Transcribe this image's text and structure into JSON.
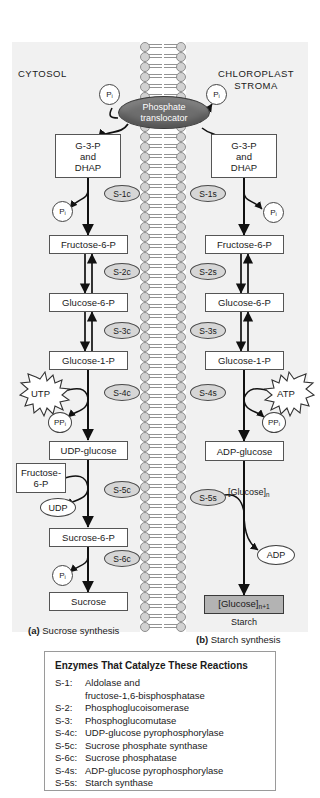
{
  "figure": {
    "compartments": {
      "left": "CYTOSOL",
      "right_line1": "CHLOROPLAST",
      "right_line2": "STROMA"
    },
    "translocator": {
      "line1": "Phosphate",
      "line2": "translocator"
    },
    "captions": {
      "a_letter": "(a)",
      "a_text": "Sucrose synthesis",
      "b_letter": "(b)",
      "b_text": "Starch synthesis"
    }
  },
  "cytosol_pathway": {
    "metabolites": [
      "G-3-P\nand\nDHAP",
      "Fructose-6-P",
      "Glucose-6-P",
      "Glucose-1-P",
      "UDP-glucose",
      "Sucrose-6-P",
      "Sucrose"
    ],
    "box1_line1": "G-3-P",
    "box1_line2": "and",
    "box1_line3": "DHAP",
    "fructose6p": "Fructose-6-P",
    "glucose6p": "Glucose-6-P",
    "glucose1p": "Glucose-1-P",
    "udp_glucose": "UDP-glucose",
    "sucrose6p": "Sucrose-6-P",
    "sucrose": "Sucrose",
    "enzymes": [
      "S-1c",
      "S-2c",
      "S-3c",
      "S-4c",
      "S-5c",
      "S-6c"
    ],
    "cofactors": {
      "pi_top": "P",
      "pi_top_sub": "i",
      "pi_s1c": "P",
      "pi_s1c_sub": "i",
      "utp": "UTP",
      "ppi": "PP",
      "ppi_sub": "i",
      "fructose_6p_side_l1": "Fructose-",
      "fructose_6p_side_l2": "6-P",
      "udp": "UDP",
      "pi_s6c": "P",
      "pi_s6c_sub": "i"
    }
  },
  "stroma_pathway": {
    "box1_line1": "G-3-P",
    "box1_line2": "and",
    "box1_line3": "DHAP",
    "fructose6p": "Fructose-6-P",
    "glucose6p": "Glucose-6-P",
    "glucose1p": "Glucose-1-P",
    "adp_glucose": "ADP-glucose",
    "glucose_n1": "[Glucose]",
    "glucose_n1_sub": "n+1",
    "starch": "Starch",
    "enzymes": [
      "S-1s",
      "S-2s",
      "S-3s",
      "S-4s",
      "S-5s"
    ],
    "cofactors": {
      "pi_top": "P",
      "pi_top_sub": "i",
      "pi_s1s": "P",
      "pi_s1s_sub": "i",
      "atp": "ATP",
      "ppi": "PP",
      "ppi_sub": "i",
      "glucose_n": "[Glucose]",
      "glucose_n_sub": "n",
      "adp": "ADP"
    }
  },
  "legend": {
    "title": "Enzymes That Catalyze These Reactions",
    "entries": [
      {
        "key": "S-1:",
        "value": "Aldolase and",
        "cont": "fructose-1,6-bisphosphatase"
      },
      {
        "key": "S-2:",
        "value": "Phosphoglucoisomerase"
      },
      {
        "key": "S-3:",
        "value": "Phosphoglucomutase"
      },
      {
        "key": "S-4c:",
        "value": "UDP-glucose pyrophosphorylase"
      },
      {
        "key": "S-5c:",
        "value": "Sucrose phosphate synthase"
      },
      {
        "key": "S-6c:",
        "value": "Sucrose phosphatase"
      },
      {
        "key": "S-4s:",
        "value": "ADP-glucose pyrophosphorylase"
      },
      {
        "key": "S-5s:",
        "value": "Starch synthase"
      }
    ]
  },
  "colors": {
    "panel_bg": "#f1f1f1",
    "enzyme_fill": "#d6d6d6",
    "translocator_fill": "#6e6e6e",
    "shaded_box": "#b3b3b3",
    "stroke": "#1a1a1a"
  }
}
